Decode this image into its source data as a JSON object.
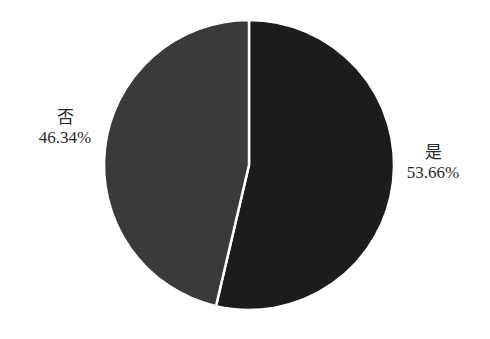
{
  "chart_data": {
    "type": "pie",
    "title": "",
    "categories": [
      "是",
      "否"
    ],
    "values": [
      53.66,
      46.34
    ],
    "unit": "%",
    "labels": [
      "53.66%",
      "46.34%"
    ],
    "colors": [
      "#1c1c1c",
      "#3a3a3a"
    ],
    "start_angle": "12 o'clock, clockwise",
    "legend": "none (inline labels)"
  },
  "slices": [
    {
      "category": "是",
      "percent_label": "53.66%"
    },
    {
      "category": "否",
      "percent_label": "46.34%"
    }
  ]
}
